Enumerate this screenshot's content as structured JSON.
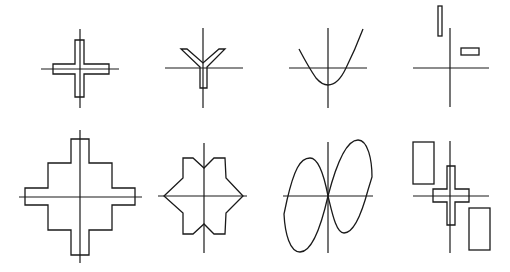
{
  "figure": {
    "stroke_color": "#1a1a1a",
    "background": "#ffffff",
    "panels": [
      {
        "id": 1,
        "row": 1,
        "col": 1,
        "shape": "plus-shaped cross outline centered on axes"
      },
      {
        "id": 2,
        "row": 1,
        "col": 2,
        "shape": "Y-shaped outline with stem below origin"
      },
      {
        "id": 3,
        "row": 1,
        "col": 3,
        "shape": "upward parabola curve with vertex below origin"
      },
      {
        "id": 4,
        "row": 1,
        "col": 4,
        "shape": "two small rectangles in upper quadrants"
      },
      {
        "id": 5,
        "row": 2,
        "col": 1,
        "shape": "stepped (staircase) cross outline"
      },
      {
        "id": 6,
        "row": 2,
        "col": 2,
        "shape": "hexagonal star-like outline with notches"
      },
      {
        "id": 7,
        "row": 2,
        "col": 3,
        "shape": "two tilted sine-like lobes crossing at origin"
      },
      {
        "id": 8,
        "row": 2,
        "col": 4,
        "shape": "cross outline with two tall rectangles in opposite quadrants"
      }
    ]
  }
}
